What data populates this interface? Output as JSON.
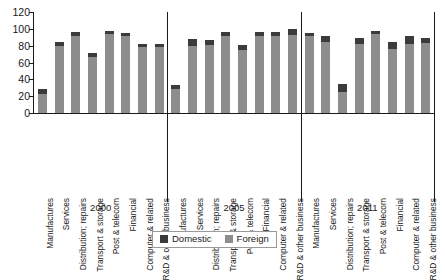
{
  "chart_data": {
    "type": "bar",
    "title": "",
    "subtitle": "",
    "xlabel": "",
    "ylabel": "",
    "ylim": [
      0,
      120
    ],
    "ytick_labels": [
      "0",
      "20",
      "40",
      "60",
      "80",
      "100",
      "120"
    ],
    "ytick_values": [
      0,
      20,
      40,
      60,
      80,
      100,
      120
    ],
    "grid": false,
    "stacked": true,
    "legend_position": "bottom-center",
    "legend": [
      "Domestic",
      "Foreign"
    ],
    "colors": {
      "domestic": "#3b3b3b",
      "foreign": "#8d8d8d",
      "axis": "#1a1a1a",
      "background": "#ffffff"
    },
    "groups": [
      "2000",
      "2005",
      "2011"
    ],
    "categories": [
      "Manufactures",
      "Services",
      "Distribution; repairs",
      "Transport & storage",
      "Post & telecom",
      "Financial",
      "Computer & related",
      "R&D & other business"
    ],
    "series": [
      {
        "name": "Foreign",
        "values_by_group": {
          "2000": [
            23,
            80,
            92,
            66,
            94,
            92,
            78,
            78
          ],
          "2005": [
            28,
            80,
            81,
            92,
            75,
            92,
            92,
            93
          ],
          "2011": [
            92,
            84,
            25,
            82,
            94,
            76,
            82,
            83
          ]
        }
      },
      {
        "name": "Domestic",
        "values_by_group": {
          "2000": [
            5,
            4,
            4,
            5,
            3,
            3,
            4,
            4
          ],
          "2005": [
            5,
            8,
            6,
            4,
            6,
            4,
            4,
            7
          ],
          "2011": [
            3,
            8,
            9,
            7,
            4,
            8,
            9,
            6
          ]
        }
      }
    ],
    "totals_by_group": {
      "2000": [
        28,
        84,
        96,
        71,
        97,
        95,
        82,
        82
      ],
      "2005": [
        33,
        88,
        87,
        96,
        81,
        96,
        96,
        100
      ],
      "2011": [
        95,
        92,
        34,
        89,
        98,
        84,
        91,
        89
      ]
    }
  },
  "legend": {
    "items": [
      {
        "label": "Domestic",
        "color": "#3b3b3b"
      },
      {
        "label": "Foreign",
        "color": "#8d8d8d"
      }
    ]
  }
}
